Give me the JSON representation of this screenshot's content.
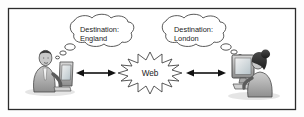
{
  "figure": {
    "border_color": "#2b2b2b",
    "background_color": "#fdfdfd",
    "ink_color": "#3c3c3c"
  },
  "left_actor": {
    "name": "man-at-computer",
    "description": "Man in suit seated at a computer"
  },
  "right_actor": {
    "name": "woman-at-computer",
    "description": "Woman seated at a desktop computer"
  },
  "thought_bubbles": [
    {
      "id": "left",
      "line1": "Destination:",
      "line2": "England"
    },
    {
      "id": "right",
      "line1": "Destination:",
      "line2": "London"
    }
  ],
  "network": {
    "label": "Web",
    "shape": "starburst"
  },
  "connectors": [
    {
      "id": "left-connector",
      "style": "double-headed-arrow"
    },
    {
      "id": "right-connector",
      "style": "double-headed-arrow"
    }
  ]
}
